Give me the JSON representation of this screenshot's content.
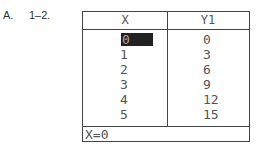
{
  "problem": {
    "letter": "A.",
    "number": "1–2."
  },
  "table": {
    "headers": [
      "X",
      "Y1"
    ],
    "rows": [
      {
        "x": "0",
        "y": "0"
      },
      {
        "x": "1",
        "y": "3"
      },
      {
        "x": "2",
        "y": "6"
      },
      {
        "x": "3",
        "y": "9"
      },
      {
        "x": "4",
        "y": "12"
      },
      {
        "x": "5",
        "y": "15"
      }
    ],
    "selected_row": 0,
    "footer": "X=0"
  }
}
